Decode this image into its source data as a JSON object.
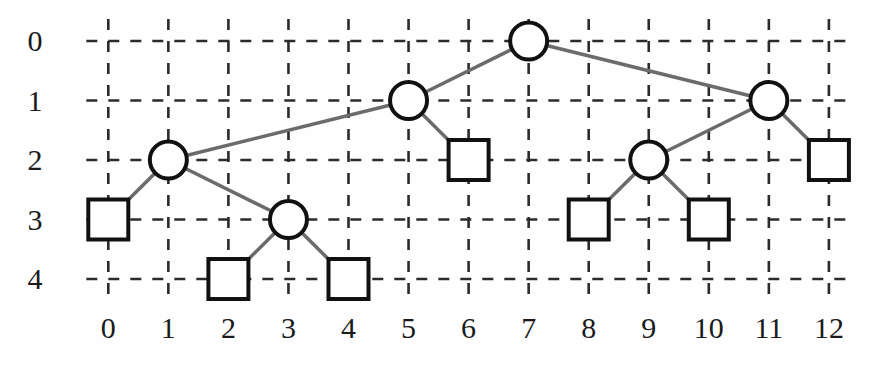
{
  "figure": {
    "type": "node-link-tree-on-grid",
    "width": 874,
    "height": 376,
    "background_color": "#fefefe"
  },
  "chart_data": {
    "type": "diagram",
    "title": "",
    "xlabel": "",
    "ylabel": "",
    "x_tick_labels": [
      "0",
      "1",
      "2",
      "3",
      "4",
      "5",
      "6",
      "7",
      "8",
      "9",
      "10",
      "11",
      "12"
    ],
    "y_tick_labels": [
      "0",
      "1",
      "2",
      "3",
      "4"
    ],
    "xlim": [
      0,
      12
    ],
    "ylim": [
      0,
      4
    ],
    "grid": true,
    "grid_style": "dashed",
    "grid_color": "#2b2b2b",
    "node_stroke_color": "#111111",
    "node_fill_color": "#ffffff",
    "edge_color": "#6b6b6b",
    "nodes": [
      {
        "id": "n7_0",
        "x": 7,
        "y": 0,
        "shape": "circle",
        "label": ""
      },
      {
        "id": "n5_1",
        "x": 5,
        "y": 1,
        "shape": "circle",
        "label": ""
      },
      {
        "id": "n11_1",
        "x": 11,
        "y": 1,
        "shape": "circle",
        "label": ""
      },
      {
        "id": "n1_2",
        "x": 1,
        "y": 2,
        "shape": "circle",
        "label": ""
      },
      {
        "id": "n6_2",
        "x": 6,
        "y": 2,
        "shape": "square",
        "label": ""
      },
      {
        "id": "n9_2",
        "x": 9,
        "y": 2,
        "shape": "circle",
        "label": ""
      },
      {
        "id": "n12_2",
        "x": 12,
        "y": 2,
        "shape": "square",
        "label": ""
      },
      {
        "id": "n0_3",
        "x": 0,
        "y": 3,
        "shape": "square",
        "label": ""
      },
      {
        "id": "n3_3",
        "x": 3,
        "y": 3,
        "shape": "circle",
        "label": ""
      },
      {
        "id": "n8_3",
        "x": 8,
        "y": 3,
        "shape": "square",
        "label": ""
      },
      {
        "id": "n10_3",
        "x": 10,
        "y": 3,
        "shape": "square",
        "label": ""
      },
      {
        "id": "n2_4",
        "x": 2,
        "y": 4,
        "shape": "square",
        "label": ""
      },
      {
        "id": "n4_4",
        "x": 4,
        "y": 4,
        "shape": "square",
        "label": ""
      }
    ],
    "edges": [
      {
        "from": "n7_0",
        "to": "n5_1"
      },
      {
        "from": "n7_0",
        "to": "n11_1"
      },
      {
        "from": "n5_1",
        "to": "n1_2"
      },
      {
        "from": "n5_1",
        "to": "n6_2"
      },
      {
        "from": "n11_1",
        "to": "n9_2"
      },
      {
        "from": "n11_1",
        "to": "n12_2"
      },
      {
        "from": "n1_2",
        "to": "n0_3"
      },
      {
        "from": "n1_2",
        "to": "n3_3"
      },
      {
        "from": "n9_2",
        "to": "n8_3"
      },
      {
        "from": "n9_2",
        "to": "n10_3"
      },
      {
        "from": "n3_3",
        "to": "n2_4"
      },
      {
        "from": "n3_3",
        "to": "n4_4"
      }
    ]
  },
  "geometry": {
    "origin_x": 108.3,
    "origin_y": 41.0,
    "step_x": 60.05,
    "step_y": 59.5,
    "circle_radius": 18.5,
    "square_size": 40,
    "node_stroke_width": 4,
    "edge_stroke_width": 3.5,
    "grid_stroke_width": 2.6,
    "grid_dash": "11 11",
    "grid_overhang": 22,
    "y_label_x": 35,
    "x_label_y": 338
  }
}
